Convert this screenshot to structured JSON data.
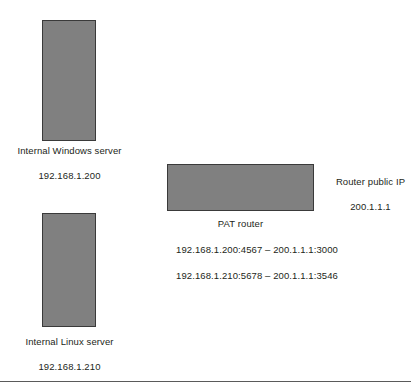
{
  "diagram": {
    "colors": {
      "node_fill": "#808080",
      "node_border": "#3a3a3a",
      "text": "#231f20",
      "rule": "#5a5a5a"
    },
    "nodes": [
      {
        "id": "windows-server",
        "name": "Internal Windows server",
        "ip": "192.168.1.200"
      },
      {
        "id": "linux-server",
        "name": "Internal Linux server",
        "ip": "192.168.1.210"
      },
      {
        "id": "pat-router",
        "name": "PAT router"
      }
    ],
    "public_ip": {
      "title": "Router public IP",
      "value": "200.1.1.1"
    },
    "pat_mappings": [
      "192.168.1.200:4567 – 200.1.1.1:3000",
      "192.168.1.210:5678 – 200.1.1.1:3546"
    ]
  }
}
